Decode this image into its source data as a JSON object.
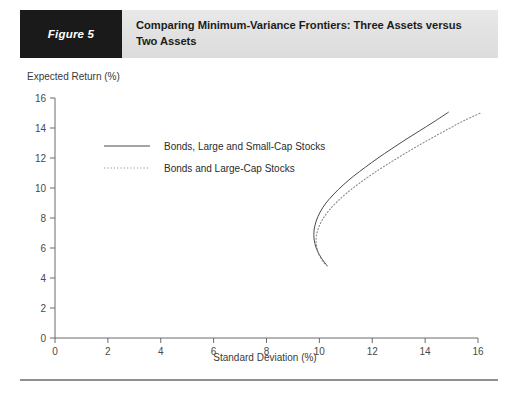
{
  "header": {
    "figure_tag": "Figure 5",
    "title_line1": "Comparing Minimum-Variance Frontiers: Three Assets versus",
    "title_line2": "Two Assets",
    "tag_bg": "#1a1a1a",
    "bar_bg": "#e4e4e4"
  },
  "chart_data": {
    "type": "line",
    "title": "Comparing Minimum-Variance Frontiers: Three Assets versus Two Assets",
    "xlabel": "Standard Deviation (%)",
    "ylabel": "Expected Return (%)",
    "xlim": [
      0,
      16
    ],
    "ylim": [
      0,
      16
    ],
    "xticks": [
      0,
      2,
      4,
      6,
      8,
      10,
      12,
      14,
      16
    ],
    "yticks": [
      0,
      2,
      4,
      6,
      8,
      10,
      12,
      14,
      16
    ],
    "xtick_labels": [
      "0",
      "2",
      "4",
      "6",
      "8",
      "10",
      "12",
      "14",
      "16"
    ],
    "ytick_labels": [
      "0",
      "2",
      "4",
      "6",
      "8",
      "10",
      "12",
      "14",
      "16"
    ],
    "grid": false,
    "legend_position": "upper-left-inside",
    "series": [
      {
        "name": "Bonds, Large and Small-Cap Stocks",
        "style": "solid",
        "color": "#4a4a4a",
        "points": [
          [
            10.3,
            4.8
          ],
          [
            10.05,
            5.4
          ],
          [
            9.88,
            6.0
          ],
          [
            9.8,
            6.6
          ],
          [
            9.8,
            7.2
          ],
          [
            9.88,
            7.8
          ],
          [
            10.03,
            8.4
          ],
          [
            10.25,
            9.0
          ],
          [
            10.55,
            9.6
          ],
          [
            10.9,
            10.2
          ],
          [
            11.3,
            10.8
          ],
          [
            11.75,
            11.4
          ],
          [
            12.22,
            12.0
          ],
          [
            12.72,
            12.6
          ],
          [
            13.24,
            13.2
          ],
          [
            13.78,
            13.8
          ],
          [
            14.32,
            14.4
          ],
          [
            14.88,
            15.05
          ]
        ]
      },
      {
        "name": "Bonds and Large-Cap Stocks",
        "style": "dotted",
        "color": "#8a8a8a",
        "points": [
          [
            10.2,
            4.95
          ],
          [
            10.0,
            5.5
          ],
          [
            9.9,
            6.1
          ],
          [
            9.88,
            6.7
          ],
          [
            9.96,
            7.3
          ],
          [
            10.12,
            7.9
          ],
          [
            10.36,
            8.5
          ],
          [
            10.68,
            9.1
          ],
          [
            11.06,
            9.7
          ],
          [
            11.5,
            10.3
          ],
          [
            11.98,
            10.9
          ],
          [
            12.5,
            11.5
          ],
          [
            13.05,
            12.1
          ],
          [
            13.62,
            12.7
          ],
          [
            14.22,
            13.3
          ],
          [
            14.84,
            13.9
          ],
          [
            15.48,
            14.5
          ],
          [
            16.1,
            15.0
          ]
        ]
      }
    ],
    "legend": [
      {
        "label": "Bonds, Large and Small-Cap Stocks",
        "style": "solid"
      },
      {
        "label": "Bonds and Large-Cap Stocks",
        "style": "dotted"
      }
    ]
  }
}
